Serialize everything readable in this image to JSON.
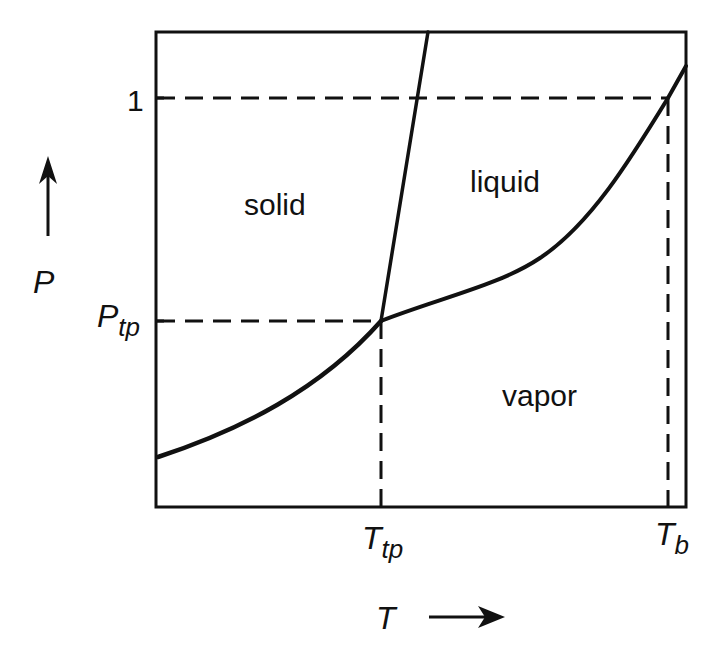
{
  "figure": {
    "type": "phase-diagram",
    "axes": {
      "x": {
        "symbol": "T",
        "direction_arrow": "right-arrow"
      },
      "y": {
        "symbol": "P",
        "direction_arrow": "up-arrow"
      }
    },
    "ticks": {
      "y": [
        {
          "main": "1",
          "sub": ""
        },
        {
          "main": "P",
          "sub": "tp"
        }
      ],
      "x": [
        {
          "main": "T",
          "sub": "tp"
        },
        {
          "main": "T",
          "sub": "b"
        }
      ]
    },
    "regions": {
      "solid": "solid",
      "liquid": "liquid",
      "vapor": "vapor"
    },
    "curves": [
      {
        "name": "sublimation-curve",
        "from": "left edge",
        "to": "triple point"
      },
      {
        "name": "melting-curve",
        "from": "triple point",
        "to": "top edge"
      },
      {
        "name": "vaporization-curve",
        "from": "triple point",
        "to": "beyond boiling point"
      }
    ],
    "reference_lines": [
      {
        "name": "p-one-line",
        "style": "dashed",
        "at": "P = 1"
      },
      {
        "name": "p-triple-line",
        "style": "dashed",
        "at": "P_tp"
      },
      {
        "name": "t-triple-line",
        "style": "dashed",
        "at": "T_tp"
      },
      {
        "name": "t-boiling-line",
        "style": "dashed",
        "at": "T_b"
      }
    ],
    "colors": {
      "ink": "#111111",
      "background": "#ffffff"
    }
  }
}
